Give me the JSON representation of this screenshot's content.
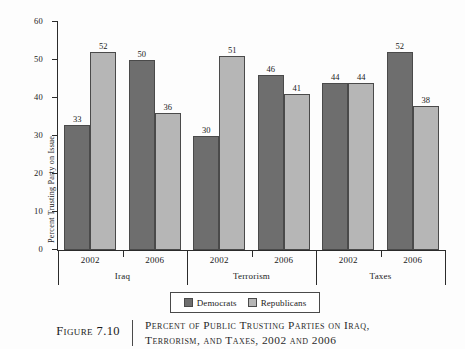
{
  "chart_data": {
    "type": "bar",
    "title": "Percent of Public Trusting Parties on Iraq, Terrorism, and Taxes, 2002 and 2006",
    "xlabel": "",
    "ylabel": "Percent Trusting Party on Issue",
    "ylim": [
      0,
      60
    ],
    "yticks": [
      0,
      10,
      20,
      30,
      40,
      50,
      60
    ],
    "ytick_labels": [
      "0",
      "10",
      "20",
      "30",
      "40",
      "50",
      "60"
    ],
    "grid": false,
    "legend_position": "bottom-center",
    "groups": [
      "Iraq",
      "Terrorism",
      "Taxes"
    ],
    "categories": [
      "2002",
      "2006",
      "2002",
      "2006",
      "2002",
      "2006"
    ],
    "series": [
      {
        "name": "Democrats",
        "color": "#6e6e6e",
        "values": [
          33,
          50,
          30,
          46,
          44,
          52
        ]
      },
      {
        "name": "Republicans",
        "color": "#b6b6b6",
        "values": [
          52,
          36,
          51,
          41,
          44,
          38
        ]
      }
    ],
    "bars": [
      {
        "group": "Iraq",
        "year": "2002",
        "party": "Democrats",
        "value": 33
      },
      {
        "group": "Iraq",
        "year": "2002",
        "party": "Republicans",
        "value": 52
      },
      {
        "group": "Iraq",
        "year": "2006",
        "party": "Democrats",
        "value": 50
      },
      {
        "group": "Iraq",
        "year": "2006",
        "party": "Republicans",
        "value": 36
      },
      {
        "group": "Terrorism",
        "year": "2002",
        "party": "Democrats",
        "value": 30
      },
      {
        "group": "Terrorism",
        "year": "2002",
        "party": "Republicans",
        "value": 51
      },
      {
        "group": "Terrorism",
        "year": "2006",
        "party": "Democrats",
        "value": 46
      },
      {
        "group": "Terrorism",
        "year": "2006",
        "party": "Republicans",
        "value": 41
      },
      {
        "group": "Taxes",
        "year": "2002",
        "party": "Democrats",
        "value": 44
      },
      {
        "group": "Taxes",
        "year": "2002",
        "party": "Republicans",
        "value": 44
      },
      {
        "group": "Taxes",
        "year": "2006",
        "party": "Democrats",
        "value": 52
      },
      {
        "group": "Taxes",
        "year": "2006",
        "party": "Republicans",
        "value": 38
      }
    ]
  },
  "legend": {
    "entries": [
      {
        "label": "Democrats",
        "color": "#6e6e6e"
      },
      {
        "label": "Republicans",
        "color": "#b6b6b6"
      }
    ]
  },
  "caption": {
    "figure_number": "Figure 7.10",
    "title_line_1": "Percent of Public Trusting Parties on Iraq,",
    "title_line_2": "Terrorism, and Taxes, 2002 and 2006"
  }
}
